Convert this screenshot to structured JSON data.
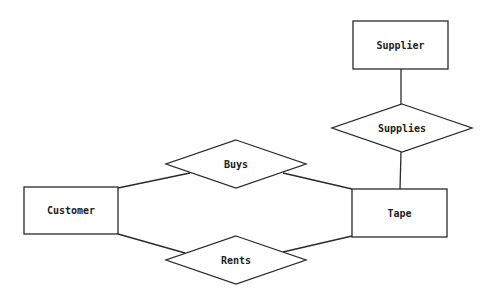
{
  "diagram": {
    "type": "entity-relationship",
    "entities": [
      {
        "id": "supplier",
        "label": "Supplier",
        "x": 353,
        "y": 21,
        "w": 95,
        "h": 48
      },
      {
        "id": "customer",
        "label": "Customer",
        "x": 24,
        "y": 187,
        "w": 94,
        "h": 47
      },
      {
        "id": "tape",
        "label": "Tape",
        "x": 352,
        "y": 189,
        "w": 95,
        "h": 48
      }
    ],
    "relationships": [
      {
        "id": "supplies",
        "label": "Supplies",
        "cx": 402,
        "cy": 128,
        "hw": 70,
        "hh": 24
      },
      {
        "id": "buys",
        "label": "Buys",
        "cx": 236,
        "cy": 164,
        "hw": 70,
        "hh": 24
      },
      {
        "id": "rents",
        "label": "Rents",
        "cx": 236,
        "cy": 260,
        "hw": 70,
        "hh": 24
      }
    ],
    "connections": [
      {
        "from": "supplier",
        "to": "supplies",
        "x1": 401,
        "y1": 69,
        "x2": 401,
        "y2": 104
      },
      {
        "from": "supplies",
        "to": "tape",
        "x1": 401,
        "y1": 152,
        "x2": 400,
        "y2": 189
      },
      {
        "from": "customer",
        "to": "buys",
        "x1": 118,
        "y1": 188,
        "x2": 190,
        "y2": 173
      },
      {
        "from": "buys",
        "to": "tape",
        "x1": 283,
        "y1": 173,
        "x2": 352,
        "y2": 189
      },
      {
        "from": "customer",
        "to": "rents",
        "x1": 118,
        "y1": 234,
        "x2": 185,
        "y2": 253
      },
      {
        "from": "rents",
        "to": "tape",
        "x1": 283,
        "y1": 252,
        "x2": 352,
        "y2": 236
      }
    ]
  }
}
